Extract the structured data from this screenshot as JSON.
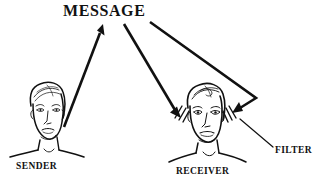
{
  "diagram": {
    "title": "MESSAGE",
    "type": "communication-model-diagram",
    "background_color": "#ffffff",
    "ink_color": "#111111",
    "labels": {
      "message": "MESSAGE",
      "sender": "SENDER",
      "receiver": "RECEIVER",
      "filter": "FILTER"
    },
    "nodes": [
      {
        "id": "message",
        "name": "message-title",
        "text": "MESSAGE",
        "x": 104,
        "y": 12
      },
      {
        "id": "sender",
        "name": "sender-figure",
        "text": "SENDER",
        "x": 46,
        "y": 128
      },
      {
        "id": "receiver",
        "name": "receiver-figure",
        "text": "RECEIVER",
        "x": 205,
        "y": 132
      },
      {
        "id": "filter",
        "name": "filter-callout",
        "text": "FILTER",
        "x": 290,
        "y": 151
      }
    ],
    "arrows": [
      {
        "id": "sender-to-message",
        "name": "arrow-sender-to-message",
        "from": "sender",
        "to": "message",
        "points": "63,126 103,26",
        "arrowhead_at": "message"
      },
      {
        "id": "message-to-receiver-left",
        "name": "arrow-message-to-receiver-left",
        "from": "message",
        "to": "receiver",
        "points": "124,24 181,116",
        "arrowhead_at": "receiver"
      },
      {
        "id": "message-to-receiver-right",
        "name": "arrow-message-to-receiver-right",
        "from": "message",
        "to": "receiver",
        "points": "150,22 256,98 233,113",
        "arrowhead_at": "receiver"
      }
    ],
    "leader_lines": [
      {
        "id": "filter-leader",
        "name": "filter-leader-line",
        "from": "receiver-filter-marks",
        "to": "filter",
        "points": "240,119 273,147"
      }
    ],
    "filter_marks": {
      "name": "filter-hatch-marks",
      "count_per_side": 3,
      "sides": [
        "left",
        "right"
      ]
    }
  }
}
